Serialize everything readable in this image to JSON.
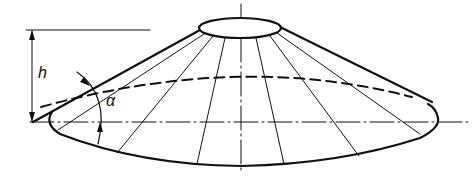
{
  "diagram": {
    "type": "truncated cone (lampshade) technical drawing",
    "labels": {
      "height": "h",
      "angle": "α"
    },
    "colors": {
      "line": "#111111",
      "background": "#ffffff"
    }
  }
}
